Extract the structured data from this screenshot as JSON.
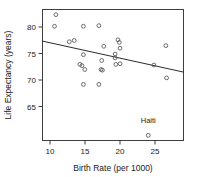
{
  "chart_data": {
    "type": "scatter",
    "title": "",
    "xlabel": "Birth Rate (per 1000)",
    "ylabel": "Life Expectancy (years)",
    "xlim": [
      8.3,
      28.3
    ],
    "ylim": [
      61.6,
      81.9
    ],
    "xticks": [
      10,
      15,
      20,
      25
    ],
    "yticks": [
      65,
      70,
      75,
      80
    ],
    "grid": false,
    "legend": null,
    "points": [
      {
        "x": 10.2,
        "y": 81.1
      },
      {
        "x": 10.0,
        "y": 79.3
      },
      {
        "x": 12.1,
        "y": 76.9
      },
      {
        "x": 12.8,
        "y": 77.1
      },
      {
        "x": 14.1,
        "y": 79.3
      },
      {
        "x": 16.3,
        "y": 79.4
      },
      {
        "x": 13.6,
        "y": 73.4
      },
      {
        "x": 13.9,
        "y": 73.2
      },
      {
        "x": 14.1,
        "y": 74.9
      },
      {
        "x": 14.3,
        "y": 72.6
      },
      {
        "x": 14.1,
        "y": 70.3
      },
      {
        "x": 16.3,
        "y": 70.3
      },
      {
        "x": 16.7,
        "y": 74.0
      },
      {
        "x": 16.6,
        "y": 72.6
      },
      {
        "x": 16.8,
        "y": 72.5
      },
      {
        "x": 17.0,
        "y": 76.2
      },
      {
        "x": 18.6,
        "y": 75.0
      },
      {
        "x": 18.6,
        "y": 74.4
      },
      {
        "x": 18.7,
        "y": 73.4
      },
      {
        "x": 19.0,
        "y": 77.2
      },
      {
        "x": 19.2,
        "y": 76.8
      },
      {
        "x": 19.3,
        "y": 75.9
      },
      {
        "x": 19.3,
        "y": 73.5
      },
      {
        "x": 24.1,
        "y": 73.3
      },
      {
        "x": 25.8,
        "y": 76.3
      },
      {
        "x": 25.9,
        "y": 71.3
      },
      {
        "x": 23.3,
        "y": 62.4,
        "label": "Haiti"
      }
    ],
    "trend_line": {
      "x_start": 8.3,
      "y_start": 77.0,
      "x_end": 28.3,
      "y_end": 72.2
    },
    "annotations": [
      {
        "text": "Haiti",
        "x": 23.3,
        "y": 64.3
      }
    ]
  },
  "axis": {
    "x_tick_labels": [
      "10",
      "15",
      "20",
      "25"
    ],
    "y_tick_labels": [
      "65",
      "70",
      "75",
      "80"
    ],
    "x_title": "Birth Rate (per 1000)",
    "y_title": "Life Expectancy (years)"
  },
  "colors": {
    "point_stroke": "#5a5a5a",
    "frame": "#3d3d3d",
    "trend": "#2b2b2b",
    "text": "#1a1a1a",
    "background": "#ffffff"
  }
}
